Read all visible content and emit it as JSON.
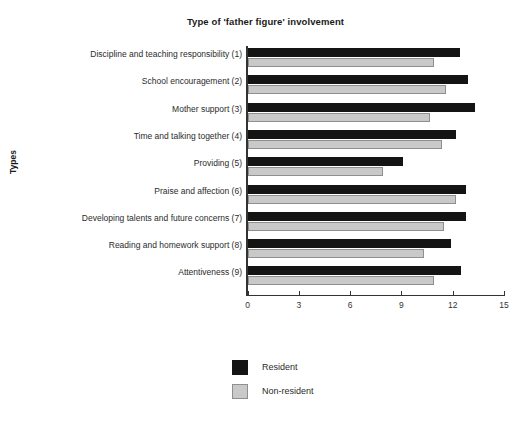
{
  "chart_data": {
    "type": "bar",
    "orientation": "horizontal",
    "title": "Type of 'father figure' involvement",
    "xlabel": "",
    "ylabel": "Types",
    "categories": [
      "Discipline and teaching responsibility (1)",
      "School encouragement (2)",
      "Mother support (3)",
      "Time and talking together (4)",
      "Providing (5)",
      "Praise and affection (6)",
      "Developing talents and future concerns (7)",
      "Reading and homework support (8)",
      "Attentiveness (9)"
    ],
    "series": [
      {
        "name": "Resident",
        "color": "#141414",
        "values": [
          12.4,
          12.9,
          13.3,
          12.2,
          9.1,
          12.8,
          12.8,
          11.9,
          12.5
        ]
      },
      {
        "name": "Non-resident",
        "color": "#c9c9c9",
        "values": [
          10.9,
          11.6,
          10.7,
          11.4,
          7.9,
          12.2,
          11.5,
          10.3,
          10.9
        ]
      }
    ],
    "xlim": [
      0,
      15
    ],
    "xticks": [
      0,
      3,
      6,
      9,
      12,
      15
    ],
    "xtick_labels": [
      "0",
      "3",
      "6",
      "9",
      "12",
      "15"
    ],
    "grid": false,
    "legend_position": "bottom-center"
  },
  "legend": {
    "entries": [
      {
        "label": "Resident",
        "swatch": "resident"
      },
      {
        "label": "Non-resident",
        "swatch": "nonresident"
      }
    ]
  }
}
